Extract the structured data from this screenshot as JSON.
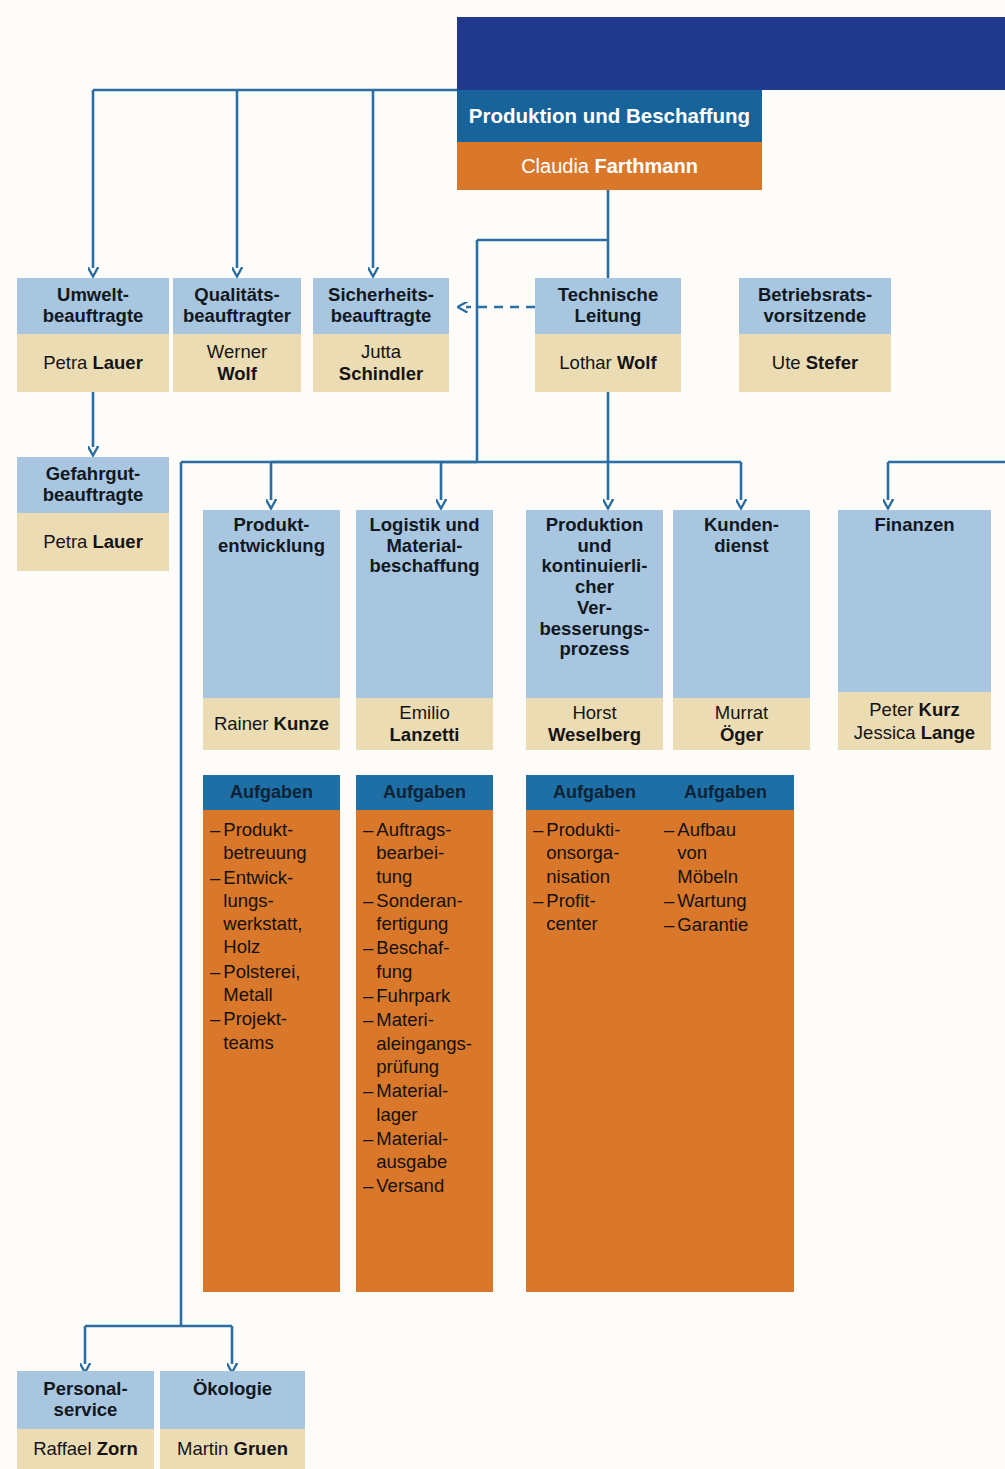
{
  "chart_title": "Organigramm Produktion und Beschaffung",
  "colors": {
    "navy": "#21398a",
    "teal_header": "#186399",
    "orange": "#d9782a",
    "light_blue": "#a8c6e0",
    "tan": "#ecdcb4",
    "task_header_blue": "#1d6fa5",
    "connector": "#2b6ea3",
    "page_background": "#fdfcf8"
  },
  "root": {
    "title": "Produktion und Beschaffung",
    "person_first": "Claudia ",
    "person_last": "Farthmann"
  },
  "officers": [
    {
      "title": "Umwelt-\nbeauftragte",
      "line1": "Umwelt-",
      "line2": "beauftragte",
      "person_first": "Petra ",
      "person_last": "Lauer"
    },
    {
      "title": "Qualitäts-\nbeauftragter",
      "line1": "Qualitäts-",
      "line2": "beauftragter",
      "person_first": "Werner",
      "person_last": "Wolf"
    },
    {
      "title": "Sicherheits-\nbeauftragte",
      "line1": "Sicherheits-",
      "line2": "beauftragte",
      "person_first": "Jutta",
      "person_last": "Schindler"
    },
    {
      "title": "Technische\nLeitung",
      "line1": "Technische",
      "line2": "Leitung",
      "person_first": "Lothar ",
      "person_last": "Wolf"
    },
    {
      "title": "Betriebsrats-\nvorsitzende",
      "line1": "Betriebsrats-",
      "line2": "vorsitzende",
      "person_first": "Ute ",
      "person_last": "Stefer"
    }
  ],
  "gefahrgut": {
    "line1": "Gefahrgut-",
    "line2": "beauftragte",
    "person_first": "Petra ",
    "person_last": "Lauer"
  },
  "departments": [
    {
      "title_lines": [
        "Produkt-",
        "entwicklung"
      ],
      "person_first": "Rainer ",
      "person_last": "Kunze",
      "person2_first": "",
      "person2_last": "",
      "tasks_header": "Aufgaben",
      "tasks": [
        [
          "Produkt-",
          "betreuung"
        ],
        [
          "Entwick-",
          "lungs-",
          "werkstatt,",
          "Holz"
        ],
        [
          "Polsterei,",
          "Metall"
        ],
        [
          "Projekt-",
          "teams"
        ]
      ]
    },
    {
      "title_lines": [
        "Logistik und",
        "Material-",
        "beschaffung"
      ],
      "person_first": "Emilio",
      "person_last": "Lanzetti",
      "person2_first": "",
      "person2_last": "",
      "tasks_header": "Aufgaben",
      "tasks": [
        [
          "Auftrags-",
          "bearbei-",
          "tung"
        ],
        [
          "Sonderan-",
          "fertigung"
        ],
        [
          "Beschaf-",
          "fung"
        ],
        [
          "Fuhrpark"
        ],
        [
          "Materi-",
          "aleingangs-",
          "prüfung"
        ],
        [
          "Material-",
          "lager"
        ],
        [
          "Material-",
          "ausgabe"
        ],
        [
          "Versand"
        ]
      ]
    },
    {
      "title_lines": [
        "Produktion",
        "und",
        "kontinuierli-",
        "cher",
        "Ver-",
        "besserungs-",
        "prozess"
      ],
      "person_first": "Horst",
      "person_last": "Weselberg",
      "person2_first": "",
      "person2_last": "",
      "tasks_header": "Aufgaben",
      "tasks": [
        [
          "Produkti-",
          "onsorga-",
          "nisation"
        ],
        [
          "Profit-",
          "center"
        ]
      ]
    },
    {
      "title_lines": [
        "Kunden-",
        "dienst"
      ],
      "person_first": "Murrat",
      "person_last": "Öger",
      "person2_first": "",
      "person2_last": "",
      "tasks_header": "Aufgaben",
      "tasks": [
        [
          "Aufbau",
          "von",
          "Möbeln"
        ],
        [
          "Wartung"
        ],
        [
          "Garantie"
        ]
      ]
    },
    {
      "title_lines": [
        "Finanzen"
      ],
      "person_first": "Peter ",
      "person_last": "Kurz",
      "person2_first": "Jessica ",
      "person2_last": "Lange",
      "tasks_header": "",
      "tasks": []
    }
  ],
  "bottom": [
    {
      "line1": "Personal-",
      "line2": "service",
      "person_first": "Raffael ",
      "person_last": "Zorn"
    },
    {
      "line1": "Ökologie",
      "line2": "",
      "person_first": "Martin ",
      "person_last": "Gruen"
    }
  ],
  "bullet_dash": "–"
}
